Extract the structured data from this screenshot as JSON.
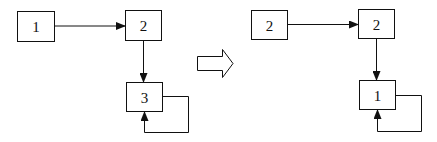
{
  "diagram": {
    "before": {
      "nodes": [
        {
          "id": "a",
          "label": "1"
        },
        {
          "id": "b",
          "label": "2"
        },
        {
          "id": "c",
          "label": "3"
        }
      ],
      "edges": [
        {
          "from": "a",
          "to": "b"
        },
        {
          "from": "b",
          "to": "c"
        },
        {
          "from": "c",
          "to": "c",
          "type": "self-loop"
        }
      ]
    },
    "transform_arrow": "outline-right-arrow",
    "after": {
      "nodes": [
        {
          "id": "a",
          "label": "2"
        },
        {
          "id": "b",
          "label": "2"
        },
        {
          "id": "c",
          "label": "1"
        }
      ],
      "edges": [
        {
          "from": "a",
          "to": "b"
        },
        {
          "from": "b",
          "to": "c"
        },
        {
          "from": "c",
          "to": "c",
          "type": "self-loop"
        }
      ]
    }
  }
}
